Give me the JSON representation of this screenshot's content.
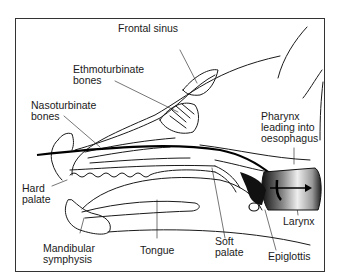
{
  "diagram": {
    "labels": {
      "frontal_sinus": "Frontal sinus",
      "ethmoturbinate": "Ethmoturbinate\nbones",
      "nasoturbinate": "Nasoturbinate\nbones",
      "pharynx": "Pharynx\nleading into\noesophagus",
      "hard_palate": "Hard\npalate",
      "mandibular_symphysis": "Mandibular\nsymphysis",
      "tongue": "Tongue",
      "soft_palate": "Soft\npalate",
      "larynx": "Larynx",
      "epiglottis": "Epiglottis"
    },
    "colors": {
      "line": "#1a1a1a",
      "frame": "#333333",
      "background": "#ffffff",
      "larynx_shade": "#3a3a3a"
    }
  }
}
